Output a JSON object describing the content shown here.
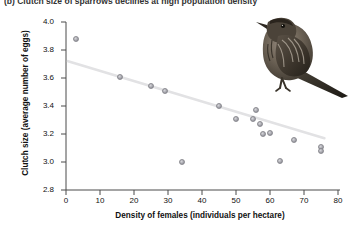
{
  "caption": "(b) Clutch size of sparrows declines at high population density",
  "chart_data": {
    "type": "scatter",
    "title": "",
    "xlabel": "Density of females (individuals per hectare)",
    "ylabel": "Clutch size (average number of eggs)",
    "xlim": [
      0,
      80
    ],
    "ylim": [
      2.8,
      4.0
    ],
    "xticks": [
      0,
      10,
      20,
      30,
      40,
      50,
      60,
      70,
      80
    ],
    "yticks": [
      "2.8",
      "3.0",
      "3.2",
      "3.4",
      "3.6",
      "3.8",
      "4.0"
    ],
    "grid": false,
    "legend": null,
    "x": [
      3,
      16,
      25,
      29,
      45,
      50,
      55,
      56,
      57,
      58,
      60,
      34,
      63,
      67,
      75,
      75
    ],
    "y": [
      3.88,
      3.61,
      3.54,
      3.51,
      3.4,
      3.31,
      3.31,
      3.37,
      3.27,
      3.2,
      3.21,
      3.0,
      3.01,
      3.16,
      3.11,
      3.08
    ],
    "series": [
      {
        "name": "Sparrow populations",
        "points": [
          {
            "x": 3,
            "y": 3.88
          },
          {
            "x": 16,
            "y": 3.61
          },
          {
            "x": 25,
            "y": 3.54
          },
          {
            "x": 29,
            "y": 3.51
          },
          {
            "x": 45,
            "y": 3.4
          },
          {
            "x": 50,
            "y": 3.31
          },
          {
            "x": 55,
            "y": 3.31
          },
          {
            "x": 56,
            "y": 3.37
          },
          {
            "x": 57,
            "y": 3.27
          },
          {
            "x": 58,
            "y": 3.2
          },
          {
            "x": 60,
            "y": 3.21
          },
          {
            "x": 34,
            "y": 3.0
          },
          {
            "x": 63,
            "y": 3.01
          },
          {
            "x": 67,
            "y": 3.16
          },
          {
            "x": 75,
            "y": 3.11
          },
          {
            "x": 75,
            "y": 3.08
          }
        ]
      }
    ],
    "trendline": {
      "type": "linear-fit",
      "x_start": 0.6,
      "y_start": 3.72,
      "x_end": 76,
      "y_end": 3.17
    },
    "annotations": [
      {
        "name": "sparrow-illustration",
        "description": "Photograph of a song sparrow perched, upper right of plot area"
      }
    ]
  }
}
